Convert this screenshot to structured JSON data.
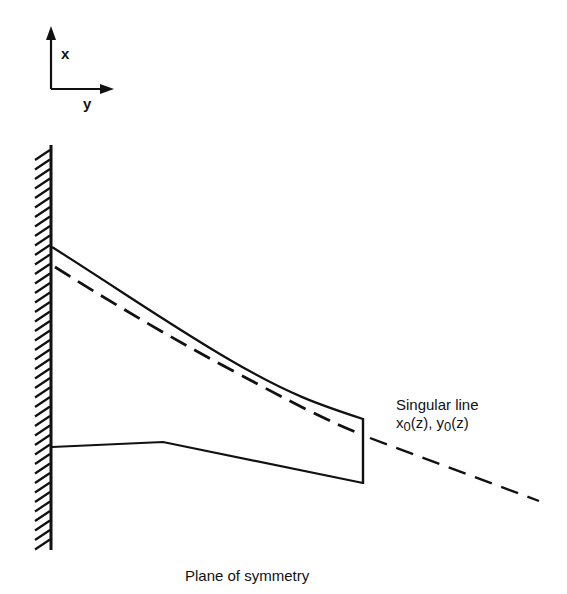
{
  "axes": {
    "x_label": "x",
    "y_label": "y"
  },
  "labels": {
    "singular_line_title": "Singular line",
    "singular_line_x": "x",
    "singular_line_x_sub": "0",
    "singular_line_x_arg": "(z), ",
    "singular_line_y": "y",
    "singular_line_y_sub": "0",
    "singular_line_y_arg": "(z)",
    "plane_of_symmetry": "Plane of symmetry"
  },
  "colors": {
    "ink": "#111111",
    "background": "#ffffff"
  }
}
